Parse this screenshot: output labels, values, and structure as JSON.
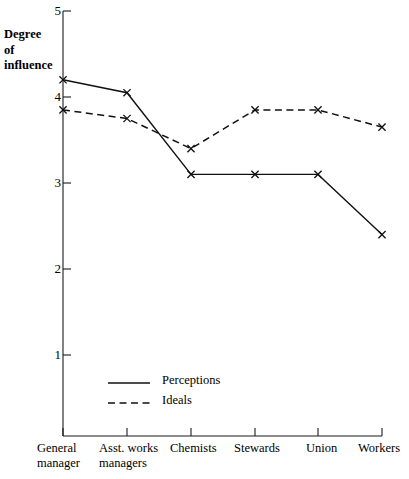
{
  "chart_data": {
    "type": "line",
    "title": "",
    "subtitle": "",
    "xlabel": "",
    "ylabel": "Degree of influence",
    "ylabel_lines": [
      "Degree",
      "of",
      "influence"
    ],
    "categories": [
      "General manager",
      "Asst. works managers",
      "Chemists",
      "Stewards",
      "Union",
      "Workers"
    ],
    "category_lines": [
      [
        "General",
        "manager"
      ],
      [
        "Asst. works",
        "managers"
      ],
      [
        "Chemists"
      ],
      [
        "Stewards"
      ],
      [
        "Union"
      ],
      [
        "Workers"
      ]
    ],
    "series": [
      {
        "name": "Perceptions",
        "style": "solid",
        "marker": "x",
        "values": [
          4.2,
          4.05,
          3.1,
          3.1,
          3.1,
          2.4
        ]
      },
      {
        "name": "Ideals",
        "style": "dashed",
        "marker": "x",
        "values": [
          3.85,
          3.75,
          3.4,
          3.85,
          3.85,
          3.65
        ]
      }
    ],
    "ylim": [
      0.62,
      5.0
    ],
    "yticks": [
      1,
      2,
      3,
      4,
      5
    ],
    "ytick_labels": [
      "1",
      "2",
      "3",
      "4",
      "5"
    ],
    "grid": false,
    "legend_position": "inside-lower-left",
    "colors": {
      "line": "#111111",
      "axis": "#1a1a1a",
      "background": "#ffffff"
    }
  },
  "legend": {
    "entries": [
      {
        "label": "Perceptions",
        "style": "solid"
      },
      {
        "label": "Ideals",
        "style": "dashed"
      }
    ]
  }
}
